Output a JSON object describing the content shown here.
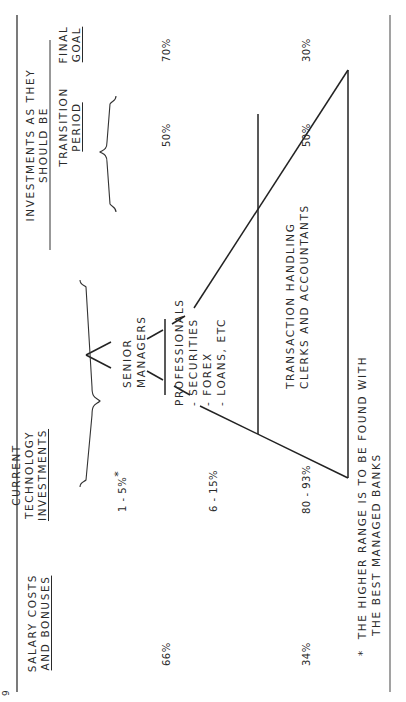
{
  "page_marker": "9",
  "columns": {
    "salary": {
      "line1": "SALARY COSTS",
      "line2": "AND BONUSES"
    },
    "current": {
      "line1": "CURRENT",
      "line2": "TECHNOLOGY",
      "line3": "INVESTMENTS"
    },
    "should_be": {
      "title_line1": "INVESTMENTS AS THEY",
      "title_line2": "SHOULD BE",
      "transition": {
        "line1": "TRANSITION",
        "line2": "PERIOD"
      },
      "final": {
        "line1": "FINAL",
        "line2": "GOAL"
      }
    }
  },
  "salary_values": {
    "upper": "66%",
    "lower": "34%"
  },
  "current_values": {
    "senior": "1 - 5%",
    "senior_mark": "*",
    "professionals": "6 - 15%",
    "transaction": "80 - 93%"
  },
  "transition_values": {
    "upper": "50%",
    "lower": "50%"
  },
  "final_values": {
    "upper": "70%",
    "lower": "30%"
  },
  "pyramid": {
    "senior": {
      "line1": "SENIOR",
      "line2": "MANAGERS"
    },
    "professionals": {
      "title": "PROFESSIONALS",
      "items": [
        "- SECURITIES",
        "- FOREX",
        "- LOANS, ETC"
      ]
    },
    "transaction": {
      "line1": "TRANSACTION HANDLING",
      "line2": "CLERKS AND ACCOUNTANTS"
    }
  },
  "footnote": {
    "mark": "*",
    "line1": "THE HIGHER RANGE IS TO BE FOUND WITH",
    "line2": "THE BEST MANAGED BANKS"
  },
  "colors": {
    "ink": "#2a2a2a",
    "paper": "#ffffff"
  }
}
